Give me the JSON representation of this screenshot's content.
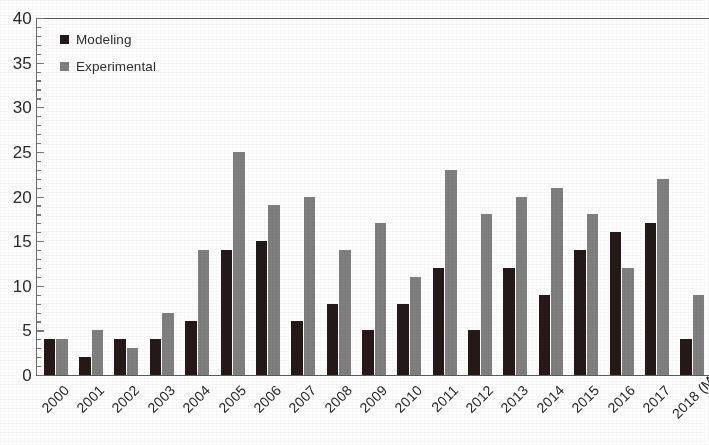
{
  "chart_data": {
    "type": "bar",
    "title": "",
    "xlabel": "",
    "ylabel": "",
    "ylim": [
      0,
      40
    ],
    "y_tick_step": 5,
    "y_minor_tick_step": 1,
    "grid": false,
    "legend_position": "top-left",
    "categories": [
      "2000",
      "2001",
      "2002",
      "2003",
      "2004",
      "2005",
      "2006",
      "2007",
      "2008",
      "2009",
      "2010",
      "2011",
      "2012",
      "2013",
      "2014",
      "2015",
      "2016",
      "2017",
      "2018 (May)"
    ],
    "y_tick_labels": [
      "0",
      "5",
      "10",
      "15",
      "20",
      "25",
      "30",
      "35",
      "40"
    ],
    "series": [
      {
        "name": "Modeling",
        "color": "#231a18",
        "values": [
          4,
          2,
          4,
          4,
          6,
          14,
          15,
          6,
          8,
          5,
          8,
          12,
          5,
          12,
          9,
          14,
          16,
          17,
          4
        ]
      },
      {
        "name": "Experimental",
        "color": "#808080",
        "values": [
          4,
          5,
          3,
          7,
          14,
          25,
          19,
          20,
          14,
          17,
          11,
          23,
          18,
          20,
          21,
          18,
          12,
          22,
          9
        ]
      }
    ]
  },
  "axes": {
    "frame_color": "#5d5d5d",
    "tick_color": "#7a7a7a",
    "label_color": "#2b2b2b"
  }
}
